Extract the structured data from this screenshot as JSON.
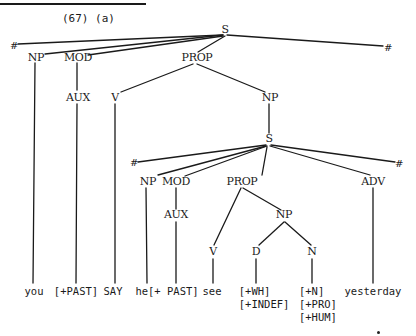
{
  "figure": {
    "caption": "(67) (a)",
    "type": "syntax tree"
  },
  "tree": {
    "root": "S",
    "boundary": "#",
    "level1": {
      "left_boundary": "#",
      "np": "NP",
      "mod": "MOD",
      "aux": "AUX",
      "prop": "PROP",
      "v": "V",
      "np2": "NP",
      "right_boundary": "#"
    },
    "embedded": {
      "s": "S",
      "left_boundary": "#",
      "np": "NP",
      "mod": "MOD",
      "aux": "AUX",
      "prop": "PROP",
      "adv": "ADV",
      "right_boundary": "#",
      "v": "V",
      "np2": "NP",
      "d": "D",
      "n": "N"
    }
  },
  "leaves": {
    "you": "you",
    "past1": "[+PAST]",
    "say": "SAY",
    "he_past": "he[+ PAST]",
    "see": "see",
    "d_features": [
      "[+WH]",
      "[+INDEF]"
    ],
    "n_features": [
      "[+N]",
      "[+PRO]",
      "[+HUM]"
    ],
    "yesterday": "yesterday"
  }
}
